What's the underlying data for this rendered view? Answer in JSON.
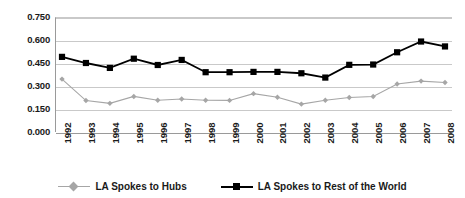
{
  "chart_data": {
    "type": "line",
    "title": "",
    "subtitle": "",
    "xlabel": "",
    "ylabel": "",
    "categories": [
      "1992",
      "1993",
      "1994",
      "1995",
      "1996",
      "1997",
      "1998",
      "1999",
      "2000",
      "2001",
      "2002",
      "2003",
      "2004",
      "2005",
      "2006",
      "2007",
      "2008"
    ],
    "ylim": [
      0.0,
      0.75
    ],
    "ytick_labels": [
      "0.750",
      "0.600",
      "0.450",
      "0.300",
      "0.150",
      "0.000"
    ],
    "ytick_values": [
      0.75,
      0.6,
      0.45,
      0.3,
      0.15,
      0.0
    ],
    "grid": true,
    "legend_position": "bottom",
    "series": [
      {
        "name": "LA Spokes to Hubs",
        "color": "#a6a6a6",
        "marker": "diamond",
        "values": [
          0.345,
          0.205,
          0.187,
          0.232,
          0.207,
          0.215,
          0.207,
          0.206,
          0.25,
          0.227,
          0.182,
          0.207,
          0.225,
          0.232,
          0.313,
          0.332,
          0.323
        ]
      },
      {
        "name": "LA Spokes to Rest of the World",
        "color": "#000000",
        "marker": "square",
        "values": [
          0.49,
          0.45,
          0.418,
          0.478,
          0.437,
          0.47,
          0.39,
          0.39,
          0.392,
          0.392,
          0.383,
          0.355,
          0.438,
          0.44,
          0.52,
          0.59,
          0.558
        ]
      }
    ]
  },
  "legend": {
    "entries": [
      {
        "label": "LA Spokes to Hubs"
      },
      {
        "label": "LA Spokes to Rest of the World"
      }
    ]
  },
  "colors": {
    "series_hubs": "#a6a6a6",
    "series_row": "#000000",
    "gridline": "#c9c9c9",
    "axis": "#9a9a9a",
    "text": "#1a1a1a",
    "background": "#ffffff"
  }
}
